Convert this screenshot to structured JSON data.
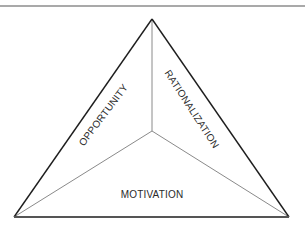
{
  "diagram": {
    "labels": {
      "opportunity": "OPPORTUNITY",
      "rationalization": "RATIONALIZATION",
      "motivation": "MOTIVATION"
    },
    "colors": {
      "outline": "#1e1e1e",
      "inner_lines": "#8a8a8a",
      "top_rule": "#8c8c8c",
      "text": "#2a2a2a",
      "background": "#ffffff"
    }
  }
}
